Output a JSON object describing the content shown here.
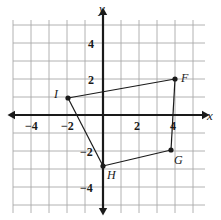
{
  "figure": {
    "background": "#ffffff",
    "grid_color": "#a9a9a9",
    "axis_color": "#1a1a1a",
    "shape_color": "#1a1a1a"
  },
  "axes": {
    "x_name": "x",
    "y_name": "y",
    "x_name_pos": {
      "x": 207,
      "y": 108
    },
    "y_name_pos": {
      "x": 99,
      "y": 1
    },
    "origin_px": {
      "x": 103,
      "y": 115
    },
    "unit_px": 18,
    "x_range": [
      -5,
      5.5
    ],
    "y_range": [
      -5.3,
      5.2
    ],
    "grid": true,
    "grid_bounds_px": {
      "left": 13,
      "top": 20,
      "right": 205,
      "bottom": 213
    }
  },
  "tick_labels": {
    "x": [
      {
        "text": "−4",
        "value": -4,
        "px": {
          "x": 25,
          "y": 119
        }
      },
      {
        "text": "−2",
        "value": -2,
        "px": {
          "x": 61,
          "y": 119
        }
      },
      {
        "text": "2",
        "value": 2,
        "px": {
          "x": 134,
          "y": 119
        }
      },
      {
        "text": "4",
        "value": 4,
        "px": {
          "x": 170,
          "y": 119
        }
      }
    ],
    "y": [
      {
        "text": "4",
        "value": 4,
        "px": {
          "x": 88,
          "y": 37
        }
      },
      {
        "text": "2",
        "value": 2,
        "px": {
          "x": 88,
          "y": 73
        }
      },
      {
        "text": "−2",
        "value": -2,
        "px": {
          "x": 80,
          "y": 145
        }
      },
      {
        "text": "−4",
        "value": -4,
        "px": {
          "x": 80,
          "y": 181
        }
      }
    ]
  },
  "chart_data": {
    "type": "scatter",
    "title": "",
    "xlabel": "x",
    "ylabel": "y",
    "xlim": [
      -5,
      5.5
    ],
    "ylim": [
      -5.3,
      5.2
    ],
    "grid": true,
    "shape": "quadrilateral FGHI",
    "points": [
      {
        "label": "F",
        "x": 4.5,
        "y": 2.0,
        "px": {
          "x": 175,
          "y": 79
        },
        "label_px": {
          "x": 181,
          "y": 71
        }
      },
      {
        "label": "G",
        "x": 4.0,
        "y": -2.5,
        "px": {
          "x": 171,
          "y": 150
        },
        "label_px": {
          "x": 174,
          "y": 153
        }
      },
      {
        "label": "H",
        "x": 0.0,
        "y": -3.5,
        "px": {
          "x": 103,
          "y": 166
        },
        "label_px": {
          "x": 107,
          "y": 168
        }
      },
      {
        "label": "I",
        "x": -2.0,
        "y": 1.0,
        "px": {
          "x": 68,
          "y": 98
        },
        "label_px": {
          "x": 54,
          "y": 87
        }
      }
    ],
    "edges": [
      [
        "F",
        "G"
      ],
      [
        "G",
        "H"
      ],
      [
        "H",
        "I"
      ],
      [
        "I",
        "F"
      ]
    ]
  }
}
